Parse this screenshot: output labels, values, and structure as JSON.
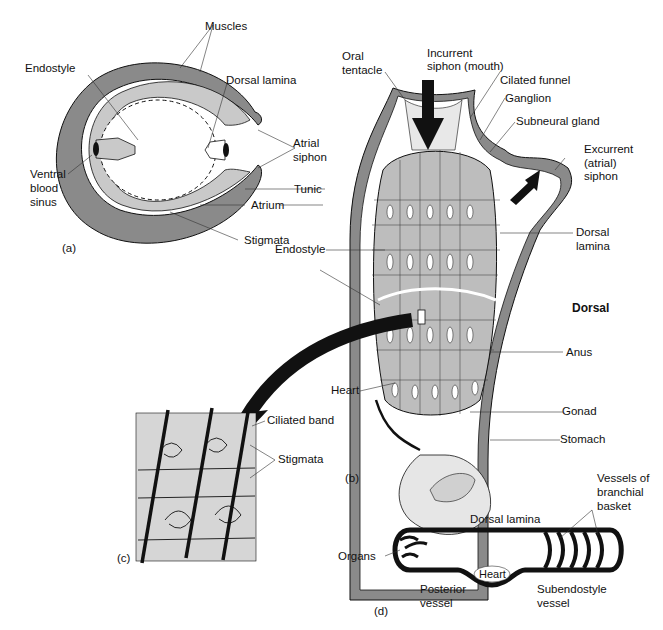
{
  "figure": {
    "panels": {
      "a": {
        "tag": "(a)",
        "description": "Cross-section of tunicate",
        "labels": {
          "muscles": "Muscles",
          "endostyle": "Endostyle",
          "dorsal_lamina": "Dorsal lamina",
          "atrial_siphon_1": "Atrial",
          "atrial_siphon_2": "siphon",
          "ventral_1": "Ventral",
          "ventral_2": "blood",
          "ventral_3": "sinus",
          "tunic": "Tunic",
          "atrium": "Atrium",
          "stigmata": "Stigmata"
        }
      },
      "b": {
        "tag": "(b)",
        "description": "Lateral view of adult tunicate",
        "labels": {
          "oral_1": "Oral",
          "oral_2": "tentacle",
          "incurrent_1": "Incurrent",
          "incurrent_2": "siphon (mouth)",
          "ciliated_funnel": "Cilated funnel",
          "ganglion": "Ganglion",
          "subneural_gland": "Subneural gland",
          "excurrent_1": "Excurrent",
          "excurrent_2": "(atrial)",
          "excurrent_3": "siphon",
          "endostyle": "Endostyle",
          "dorsal_lamina_1": "Dorsal",
          "dorsal_lamina_2": "lamina",
          "dorsal": "Dorsal",
          "anus": "Anus",
          "heart": "Heart",
          "gonad": "Gonad",
          "stomach": "Stomach"
        }
      },
      "c": {
        "tag": "(c)",
        "description": "Detail of pharyngeal basket wall",
        "labels": {
          "ciliated_band": "Ciliated band",
          "stigmata": "Stigmata"
        }
      },
      "d": {
        "tag": "(d)",
        "description": "Circulatory scheme",
        "labels": {
          "vessels_1": "Vessels of",
          "vessels_2": "branchial",
          "vessels_3": "basket",
          "dorsal_lamina": "Dorsal lamina",
          "organs": "Organs",
          "heart": "Heart",
          "posterior_1": "Posterior",
          "posterior_2": "vessel",
          "subendostyle_1": "Subendostyle",
          "subendostyle_2": "vessel"
        }
      }
    },
    "colors": {
      "tunic_gray": "#8a8a8a",
      "tissue_light": "#c9c9c9",
      "ink": "#111111"
    }
  }
}
